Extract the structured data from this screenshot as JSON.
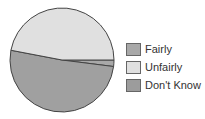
{
  "chart_data": {
    "type": "pie",
    "title": "",
    "categories": [
      "Fairly",
      "Unfairly",
      "Don't Know"
    ],
    "values": [
      2,
      47,
      51
    ],
    "colors": [
      "#a8a8a8",
      "#e0e0e0",
      "#a0a0a0"
    ],
    "legend_position": "right"
  },
  "legend": [
    {
      "label": "Fairly",
      "color": "#a8a8a8"
    },
    {
      "label": "Unfairly",
      "color": "#e0e0e0"
    },
    {
      "label": "Don't Know",
      "color": "#9c9c9c"
    }
  ]
}
